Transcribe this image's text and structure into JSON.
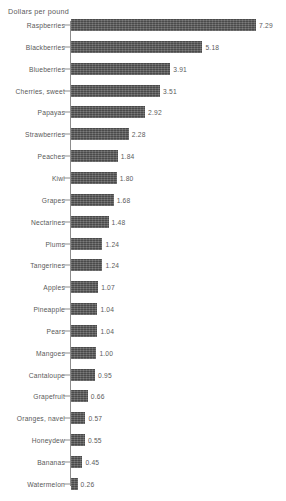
{
  "chart_data": {
    "type": "bar",
    "orientation": "horizontal",
    "title": "Dollars per pound",
    "xlabel": "",
    "ylabel": "",
    "xlim": [
      0,
      7.29
    ],
    "grid": false,
    "legend": null,
    "value_labels": true,
    "categories": [
      "Raspberries",
      "Blackberries",
      "Blueberries",
      "Cherries, sweet",
      "Papayas",
      "Strawberries",
      "Peaches",
      "Kiwi",
      "Grapes",
      "Nectarines",
      "Plums",
      "Tangerines",
      "Apples",
      "Pineapple",
      "Pears",
      "Mangoes",
      "Cantaloupe",
      "Grapefruit",
      "Oranges, navel",
      "Honeydew",
      "Bananas",
      "Watermelon"
    ],
    "values": [
      7.29,
      5.18,
      3.91,
      3.51,
      2.92,
      2.28,
      1.84,
      1.8,
      1.68,
      1.48,
      1.24,
      1.24,
      1.07,
      1.04,
      1.04,
      1.0,
      0.95,
      0.66,
      0.57,
      0.55,
      0.45,
      0.26
    ],
    "value_text": [
      "7.29",
      "5.18",
      "3.91",
      "3.51",
      "2.92",
      "2.28",
      "1.84",
      "1.80",
      "1.68",
      "1.48",
      "1.24",
      "1.24",
      "1.07",
      "1.04",
      "1.04",
      "1.00",
      "0.95",
      "0.66",
      "0.57",
      "0.55",
      "0.45",
      "0.26"
    ],
    "colors": {
      "bar": "#585858",
      "axis": "#8d8d8d",
      "text": "#595959",
      "background": "#ffffff"
    }
  }
}
